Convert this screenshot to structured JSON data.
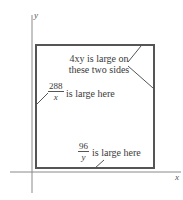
{
  "diagram": {
    "axes": {
      "x_label": "x",
      "y_label": "y"
    },
    "rectangle": {
      "stroke_color": "#555555"
    },
    "annotations": {
      "top_right": {
        "line1": "4xy is large on",
        "line2": "these two sides"
      },
      "left": {
        "numerator": "288",
        "denominator": "x",
        "text": "is large here"
      },
      "bottom": {
        "numerator": "96",
        "denominator": "y",
        "text": "is large here"
      }
    },
    "colors": {
      "axis": "#888888",
      "box": "#555555",
      "text": "#3a3a3a"
    }
  }
}
